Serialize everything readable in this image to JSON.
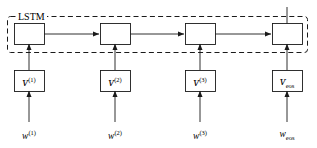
{
  "figure": {
    "type": "lstm-unrolled-diagram",
    "width": 317,
    "height": 148,
    "background_color": "#ffffff",
    "line_color": "#1a1a1a",
    "text_color": "#000000"
  },
  "lstm_group": {
    "label": "LSTM",
    "border_style": "dashed",
    "name": "lstm-dashed-boundary"
  },
  "columns": [
    {
      "index": 1,
      "center_x": 29,
      "lstm_cell_name": "lstm-cell-1",
      "v_label_base": "ᴠ",
      "v_label_script": "(1)",
      "v_script_kind": "sup",
      "w_label_base": "w",
      "w_label_script": "(1)",
      "w_script_kind": "sup"
    },
    {
      "index": 2,
      "center_x": 115,
      "lstm_cell_name": "lstm-cell-2",
      "v_label_base": "ᴠ",
      "v_label_script": "(2)",
      "v_script_kind": "sup",
      "w_label_base": "w",
      "w_label_script": "(2)",
      "w_script_kind": "sup"
    },
    {
      "index": 3,
      "center_x": 200,
      "lstm_cell_name": "lstm-cell-3",
      "v_label_base": "ᴠ",
      "v_label_script": "(3)",
      "v_script_kind": "sup",
      "w_label_base": "w",
      "w_label_script": "(3)",
      "w_script_kind": "sup"
    },
    {
      "index": 4,
      "center_x": 287,
      "lstm_cell_name": "lstm-cell-eos",
      "v_label_base": "ᴠ",
      "v_label_script": "eos",
      "v_script_kind": "sub",
      "w_label_base": "w",
      "w_label_script": "eos",
      "w_script_kind": "sub"
    }
  ],
  "connections": {
    "recurrent_arrows": 3,
    "embedding_to_lstm_arrows": 4,
    "word_to_embedding_arrows": 4,
    "output_line_from_last_cell": true
  }
}
